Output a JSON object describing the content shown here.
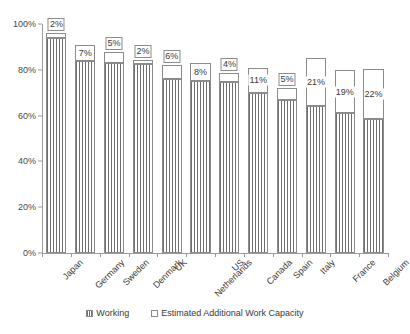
{
  "chart_data": {
    "type": "bar",
    "title": "",
    "subtitle": "",
    "xlabel": "",
    "ylabel": "",
    "ylim": [
      0,
      100
    ],
    "ytick_labels": [
      "0%",
      "20%",
      "40%",
      "60%",
      "80%",
      "100%"
    ],
    "ytick_values": [
      0,
      20,
      40,
      60,
      80,
      100
    ],
    "grid": false,
    "stacked": true,
    "legend_position": "bottom",
    "categories": [
      "Japan",
      "Germany",
      "Sweden",
      "Denmark",
      "UK",
      "Netherlands",
      "US",
      "Canada",
      "Spain",
      "Italy",
      "France",
      "Belgium"
    ],
    "series": [
      {
        "name": "Working",
        "values": [
          94,
          84,
          83,
          82.5,
          76,
          75,
          74.5,
          70,
          67,
          64,
          61,
          58.5
        ]
      },
      {
        "name": "Estimated Additional Work Capacity",
        "values": [
          2,
          7,
          5,
          2,
          6,
          8,
          4,
          11,
          5,
          21,
          19,
          22
        ],
        "data_labels": [
          "2%",
          "7%",
          "5%",
          "2%",
          "6%",
          "8%",
          "4%",
          "11%",
          "5%",
          "21%",
          "19%",
          "22%"
        ]
      }
    ],
    "totals": [
      96,
      91,
      88,
      84.5,
      82,
      83,
      78.5,
      81,
      72,
      85,
      80,
      80.5
    ]
  },
  "legend": {
    "items": [
      {
        "label": "Working",
        "marker": "hatched-square-icon",
        "color": "#6f6f6f"
      },
      {
        "label": "Estimated Additional Work Capacity",
        "marker": "empty-square-icon",
        "color": "#ffffff"
      }
    ]
  },
  "colors": {
    "axis": "#9a9a9a",
    "bar_outline": "#8c8c8c",
    "bar_hatch": "#6f6f6f",
    "bar_fill": "#ffffff",
    "text": "#3a3a3a",
    "background": "#ffffff"
  }
}
